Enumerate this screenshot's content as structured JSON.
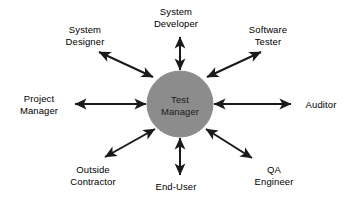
{
  "diagram": {
    "type": "hub-and-spoke",
    "background_color": "#ffffff",
    "line_color": "#1a1a1a",
    "text_color": "#000000",
    "hub": {
      "id": "test-manager",
      "shape": "circle",
      "fill_color": "#8c8c8c",
      "stroke_color": "#8c8c8c",
      "center_x": 180,
      "center_y": 104,
      "radius": 33,
      "lines": [
        "Test",
        "Manager"
      ]
    },
    "connector_style": {
      "arrowheads": "both",
      "stroke_width": 2,
      "description": "bidirectional double-headed arrow"
    },
    "nodes": [
      {
        "id": "system-designer",
        "lines": [
          "System",
          "Designer"
        ],
        "direction": "upper-left",
        "angle_deg": 135,
        "arrow": "double"
      },
      {
        "id": "system-developer",
        "lines": [
          "System",
          "Developer"
        ],
        "direction": "up",
        "angle_deg": 90,
        "arrow": "double"
      },
      {
        "id": "software-tester",
        "lines": [
          "Software",
          "Tester"
        ],
        "direction": "upper-right",
        "angle_deg": 45,
        "arrow": "double"
      },
      {
        "id": "project-manager",
        "lines": [
          "Project",
          "Manager"
        ],
        "direction": "left",
        "angle_deg": 180,
        "arrow": "double"
      },
      {
        "id": "auditor",
        "lines": [
          "Auditor"
        ],
        "direction": "right",
        "angle_deg": 0,
        "arrow": "double"
      },
      {
        "id": "outside-contractor",
        "lines": [
          "Outside",
          "Contractor"
        ],
        "direction": "lower-left",
        "angle_deg": 225,
        "arrow": "double"
      },
      {
        "id": "end-user",
        "lines": [
          "End-User"
        ],
        "direction": "down",
        "angle_deg": 270,
        "arrow": "double"
      },
      {
        "id": "qa-engineer",
        "lines": [
          "QA",
          "Engineer"
        ],
        "direction": "lower-right",
        "angle_deg": 315,
        "arrow": "double"
      }
    ]
  }
}
